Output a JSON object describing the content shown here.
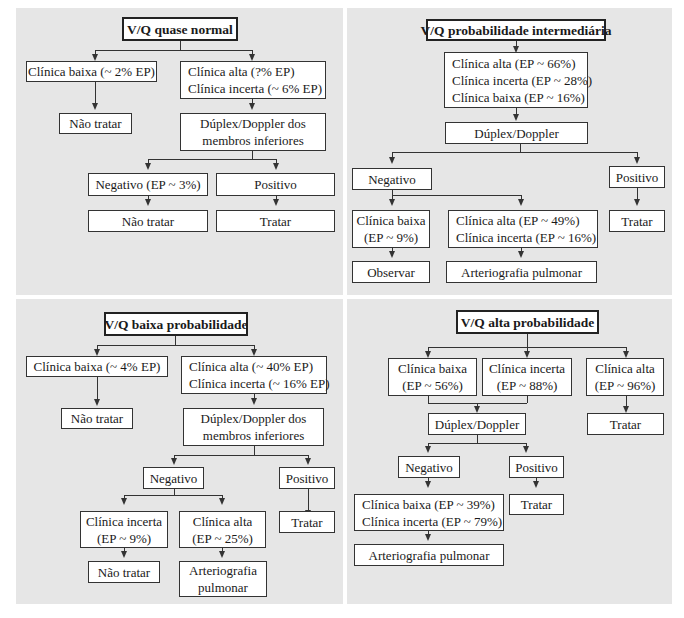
{
  "colors": {
    "panel_bg": "#e6e6e6",
    "box_bg": "#ffffff",
    "border": "#333333"
  },
  "quadrants": {
    "normal": {
      "title": "V/Q quase normal",
      "low_clinical": "Clínica baixa (~ 2% EP)",
      "low_action": "Não tratar",
      "high_clinical": [
        "Clínica alta (?% EP)",
        "Clínica incerta (~ 6% EP)"
      ],
      "doppler": [
        "Dúplex/Doppler dos",
        "membros inferiores"
      ],
      "negative": "Negativo (EP ~ 3%)",
      "positive": "Positivo",
      "negative_action": "Não tratar",
      "positive_action": "Tratar"
    },
    "intermediate": {
      "title": "V/Q probabilidade intermediária",
      "clinical": [
        "Clínica alta (EP ~ 66%)",
        "Clínica incerta (EP ~ 28%)",
        "Clínica baixa (EP ~ 16%)"
      ],
      "doppler": "Dúplex/Doppler",
      "negative": "Negativo",
      "positive": "Positivo",
      "positive_action": "Tratar",
      "neg_low": [
        "Clínica baixa",
        "(EP ~ 9%)"
      ],
      "neg_low_action": "Observar",
      "neg_high": [
        "Clínica alta (EP ~ 49%)",
        "Clínica incerta (EP ~ 16%)"
      ],
      "neg_high_action": "Arteriografia pulmonar"
    },
    "low": {
      "title": "V/Q baixa probabilidade",
      "low_clinical": "Clínica baixa (~ 4% EP)",
      "low_action": "Não tratar",
      "high_clinical": [
        "Clínica alta (~ 40% EP)",
        "Clínica incerta (~ 16% EP)"
      ],
      "doppler": [
        "Dúplex/Doppler dos",
        "membros inferiores"
      ],
      "negative": "Negativo",
      "positive": "Positivo",
      "positive_action": "Tratar",
      "neg_uncertain": [
        "Clínica incerta",
        "(EP ~ 9%)"
      ],
      "neg_uncertain_action": "Não tratar",
      "neg_high": [
        "Clínica alta",
        "(EP ~ 25%)"
      ],
      "neg_high_action": [
        "Arteriografia",
        "pulmonar"
      ]
    },
    "high": {
      "title": "V/Q alta probabilidade",
      "low_clinical": [
        "Clínica baixa",
        "(EP ~ 56%)"
      ],
      "uncertain_clinical": [
        "Clínica incerta",
        "(EP ~ 88%)"
      ],
      "high_clinical": [
        "Clínica alta",
        "(EP ~ 96%)"
      ],
      "high_action": "Tratar",
      "doppler": "Dúplex/Doppler",
      "negative": "Negativo",
      "positive": "Positivo",
      "positive_action": "Tratar",
      "neg_result": [
        "Clínica baixa (EP ~ 39%)",
        "Clínica incerta (EP ~ 79%)"
      ],
      "neg_action": "Arteriografia pulmonar"
    }
  }
}
